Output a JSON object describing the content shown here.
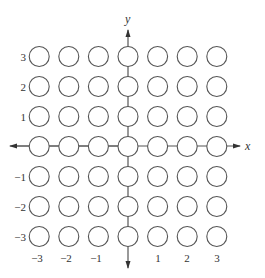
{
  "diagram": {
    "x_axis_label": "x",
    "y_axis_label": "y",
    "x_ticks": [
      "-3",
      "-2",
      "-1",
      "1",
      "2",
      "3"
    ],
    "y_ticks": [
      "3",
      "2",
      "1",
      "-1",
      "-2",
      "-3"
    ],
    "x_range": [
      -3,
      3
    ],
    "y_range": [
      -3,
      3
    ],
    "grid_points": "all integer (x, y) with -3 <= x <= 3 and -3 <= y <= 3",
    "point_count": 49,
    "stroke_color": "#555555"
  }
}
